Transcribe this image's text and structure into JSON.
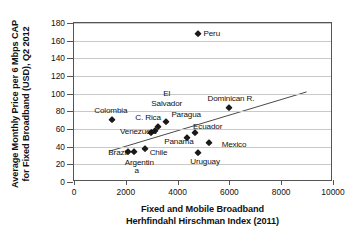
{
  "chart_data": {
    "type": "scatter",
    "title": "",
    "xlabel": "Fixed and Mobile Broadband Herhfindahl Hirschman Index (2011)",
    "xlabel_lines": [
      "Fixed and Mobile Broadband",
      "Herhfindahl Hirschman Index (2011)"
    ],
    "ylabel": "Average Monthly Price per 6 Mbps CAP for Fixed Broadband (USD), Q2 2012",
    "ylabel_lines": [
      "Average Monthly Price per 6 Mbps CAP",
      "for Fixed Broadband (USD), Q2 2012"
    ],
    "xlim": [
      0,
      10000
    ],
    "ylim": [
      0,
      180
    ],
    "xticks": [
      0,
      2000,
      4000,
      6000,
      8000,
      10000
    ],
    "yticks": [
      0,
      20,
      40,
      60,
      80,
      100,
      120,
      140,
      160,
      180
    ],
    "grid": "horizontal",
    "legend": "none",
    "marker": "diamond",
    "marker_color": "#1a1a1a",
    "points": [
      {
        "label": "Peru",
        "x": 4800,
        "y": 168
      },
      {
        "label": "Colombia",
        "x": 1450,
        "y": 70
      },
      {
        "label": "Dominican R.",
        "x": 6000,
        "y": 84
      },
      {
        "label": "El Salvador",
        "x": 3560,
        "y": 68
      },
      {
        "label": "Paraguay",
        "x": 3240,
        "y": 62
      },
      {
        "label": "C. Rica",
        "x": 3120,
        "y": 58
      },
      {
        "label": "Venezuela",
        "x": 2960,
        "y": 55
      },
      {
        "label": "Ecuador",
        "x": 4680,
        "y": 56
      },
      {
        "label": "Panama",
        "x": 4360,
        "y": 50
      },
      {
        "label": "Mexico",
        "x": 5200,
        "y": 44
      },
      {
        "label": "Uruguay",
        "x": 4780,
        "y": 33
      },
      {
        "label": "Brazil",
        "x": 2080,
        "y": 34
      },
      {
        "label": "Brazil",
        "x": 2300,
        "y": 34
      },
      {
        "label": "Argentina",
        "x": 2740,
        "y": 37
      }
    ],
    "trendline": {
      "x0": 1380,
      "y0": 33,
      "x1": 9050,
      "y1": 101
    }
  },
  "annotations": [
    {
      "name": "peru-label",
      "text": "Peru",
      "x": 5000,
      "y": 168,
      "align": "left"
    },
    {
      "name": "colombia-label",
      "text": "Colombia",
      "x": 1420,
      "y": 81,
      "align": "center"
    },
    {
      "name": "dominican-label",
      "text": "Dominican R.",
      "x": 6060,
      "y": 95,
      "align": "center"
    },
    {
      "name": "el-label",
      "text": "El",
      "x": 3580,
      "y": 100,
      "align": "center"
    },
    {
      "name": "salvador-label",
      "text": "Salvador",
      "x": 3580,
      "y": 89,
      "align": "center"
    },
    {
      "name": "paraguay-label",
      "text": "Paragua",
      "x": 3760,
      "y": 76,
      "align": "left"
    },
    {
      "name": "crica-label",
      "text": "C. Rica",
      "x": 2860,
      "y": 73,
      "align": "center"
    },
    {
      "name": "venezuela-label",
      "text": "Venezuela",
      "x": 2480,
      "y": 57,
      "align": "center"
    },
    {
      "name": "ecuador-label",
      "text": "Ecuador",
      "x": 5160,
      "y": 63,
      "align": "center"
    },
    {
      "name": "panama-label",
      "text": "Panama",
      "x": 4050,
      "y": 46,
      "align": "center"
    },
    {
      "name": "mexico-label",
      "text": "Mexico",
      "x": 5700,
      "y": 43,
      "align": "left"
    },
    {
      "name": "uruguay-label",
      "text": "Uruguay",
      "x": 5060,
      "y": 23,
      "align": "center"
    },
    {
      "name": "brazil-label",
      "text": "Brazil",
      "x": 1700,
      "y": 33,
      "align": "center"
    },
    {
      "name": "chile-label",
      "text": "Chile",
      "x": 2920,
      "y": 33,
      "align": "left"
    },
    {
      "name": "argentina-label",
      "text": "Argentin",
      "x": 2520,
      "y": 22,
      "align": "center"
    },
    {
      "name": "argentina-label-2",
      "text": "a",
      "x": 2420,
      "y": 13,
      "align": "center"
    }
  ]
}
